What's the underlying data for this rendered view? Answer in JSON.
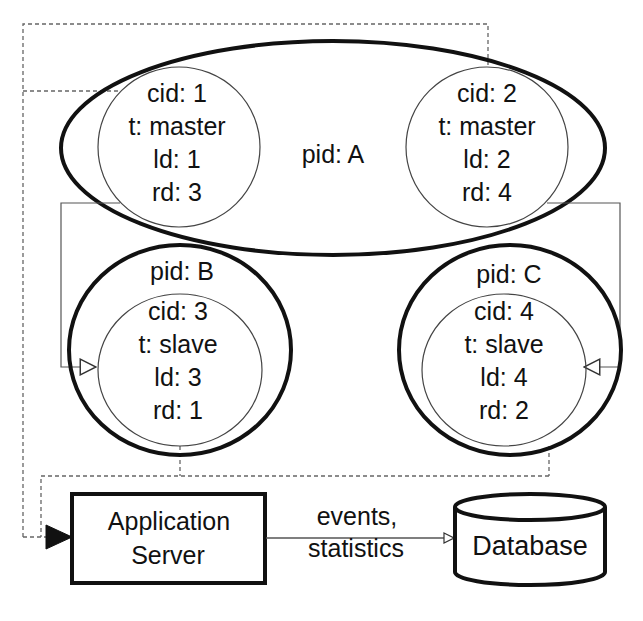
{
  "diagram": {
    "colors": {
      "stroke": "#111111",
      "thin_stroke": "#555555",
      "dashed": "#666666",
      "background": "#ffffff"
    },
    "processes": [
      {
        "pid_label": "pid: A",
        "containers": [
          {
            "cid": "cid: 1",
            "type": "t: master",
            "ld": "ld: 1",
            "rd": "rd: 3"
          },
          {
            "cid": "cid: 2",
            "type": "t: master",
            "ld": "ld: 2",
            "rd": "rd: 4"
          }
        ]
      },
      {
        "pid_label": "pid: B",
        "containers": [
          {
            "cid": "cid: 3",
            "type": "t: slave",
            "ld": "ld: 3",
            "rd": "rd: 1"
          }
        ]
      },
      {
        "pid_label": "pid: C",
        "containers": [
          {
            "cid": "cid: 4",
            "type": "t: slave",
            "ld": "ld: 4",
            "rd": "rd: 2"
          }
        ]
      }
    ],
    "app_server": {
      "line1": "Application",
      "line2": "Server"
    },
    "edge_label": {
      "line1": "events,",
      "line2": "statistics"
    },
    "database": {
      "label": "Database"
    }
  }
}
